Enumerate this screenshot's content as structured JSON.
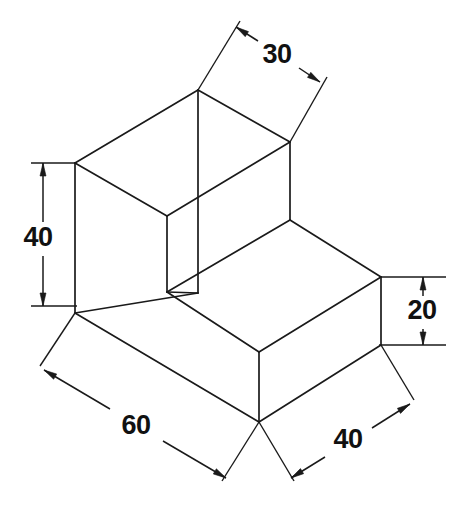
{
  "drawing": {
    "type": "isometric-technical-drawing",
    "subject": "stepped-block",
    "background_color": "#ffffff",
    "line_color": "#1a1a1a",
    "canvas": {
      "width": 458,
      "height": 508
    },
    "dimensions": [
      {
        "id": "depth-top",
        "label": "30",
        "text_x": 277,
        "text_y": 56,
        "line_start_x": 236,
        "line_start_y": 27,
        "line_end_x": 320,
        "line_end_y": 82,
        "gap_start_x": 258,
        "gap_start_y": 41,
        "gap_end_x": 299,
        "gap_end_y": 68,
        "ext_lines": [
          {
            "x1": 198,
            "y1": 90,
            "x2": 240,
            "y2": 21
          },
          {
            "x1": 290,
            "y1": 142,
            "x2": 327,
            "y2": 77
          }
        ]
      },
      {
        "id": "height-tall",
        "label": "40",
        "text_x": 38,
        "text_y": 239,
        "line_start_x": 43,
        "line_start_y": 163,
        "line_end_x": 43,
        "line_end_y": 306,
        "gap_start_x": 43,
        "gap_start_y": 222,
        "gap_end_x": 43,
        "gap_end_y": 256,
        "ext_lines": [
          {
            "x1": 31,
            "y1": 163,
            "x2": 77,
            "y2": 163
          },
          {
            "x1": 31,
            "y1": 306,
            "x2": 77,
            "y2": 306
          }
        ]
      },
      {
        "id": "height-step",
        "label": "20",
        "text_x": 422,
        "text_y": 312,
        "line_start_x": 423,
        "line_start_y": 277,
        "line_end_x": 423,
        "line_end_y": 345,
        "gap_start_x": 423,
        "gap_start_y": 296,
        "gap_end_x": 423,
        "gap_end_y": 329,
        "ext_lines": [
          {
            "x1": 379,
            "y1": 277,
            "x2": 446,
            "y2": 277
          },
          {
            "x1": 379,
            "y1": 345,
            "x2": 446,
            "y2": 345
          }
        ]
      },
      {
        "id": "width-front-left",
        "label": "60",
        "text_x": 136,
        "text_y": 427,
        "line_start_x": 44,
        "line_start_y": 370,
        "line_end_x": 226,
        "line_end_y": 478,
        "gap_start_x": 110,
        "gap_start_y": 409,
        "gap_end_x": 163,
        "gap_end_y": 441,
        "ext_lines": [
          {
            "x1": 75,
            "y1": 313,
            "x2": 40,
            "y2": 366
          },
          {
            "x1": 259,
            "y1": 422,
            "x2": 222,
            "y2": 481
          }
        ]
      },
      {
        "id": "width-front-right",
        "label": "40",
        "text_x": 348,
        "text_y": 441,
        "line_start_x": 291,
        "line_start_y": 478,
        "line_end_x": 410,
        "line_end_y": 404,
        "gap_start_x": 325,
        "gap_start_y": 457,
        "gap_end_x": 372,
        "gap_end_y": 428,
        "ext_lines": [
          {
            "x1": 259,
            "y1": 422,
            "x2": 294,
            "y2": 481
          },
          {
            "x1": 381,
            "y1": 345,
            "x2": 414,
            "y2": 400
          }
        ]
      }
    ],
    "edges": [
      {
        "id": "top-face-back-left",
        "x1": 75,
        "y1": 163,
        "x2": 198,
        "y2": 90
      },
      {
        "id": "top-face-back-right",
        "x1": 198,
        "y1": 90,
        "x2": 290,
        "y2": 142
      },
      {
        "id": "top-face-front-right",
        "x1": 290,
        "y1": 142,
        "x2": 167,
        "y2": 216
      },
      {
        "id": "top-face-front-left",
        "x1": 167,
        "y1": 216,
        "x2": 75,
        "y2": 163
      },
      {
        "id": "tall-vert-back",
        "x1": 198,
        "y1": 90,
        "x2": 198,
        "y2": 293
      },
      {
        "id": "tall-vert-left",
        "x1": 75,
        "y1": 163,
        "x2": 75,
        "y2": 313
      },
      {
        "id": "tall-vert-front",
        "x1": 167,
        "y1": 216,
        "x2": 167,
        "y2": 292
      },
      {
        "id": "tall-vert-right",
        "x1": 290,
        "y1": 142,
        "x2": 290,
        "y2": 220
      },
      {
        "id": "step-top-left",
        "x1": 167,
        "y1": 292,
        "x2": 259,
        "y2": 352
      },
      {
        "id": "step-top-right",
        "x1": 290,
        "y1": 220,
        "x2": 381,
        "y2": 277
      },
      {
        "id": "step-top-front",
        "x1": 259,
        "y1": 352,
        "x2": 381,
        "y2": 277
      },
      {
        "id": "step-top-back",
        "x1": 167,
        "y1": 292,
        "x2": 290,
        "y2": 220
      },
      {
        "id": "base-front-left",
        "x1": 75,
        "y1": 313,
        "x2": 259,
        "y2": 422
      },
      {
        "id": "base-front-right",
        "x1": 259,
        "y1": 422,
        "x2": 381,
        "y2": 345
      },
      {
        "id": "base-vert-front",
        "x1": 259,
        "y1": 352,
        "x2": 259,
        "y2": 422
      },
      {
        "id": "base-vert-right",
        "x1": 381,
        "y1": 277,
        "x2": 381,
        "y2": 345
      },
      {
        "id": "base-left-edge",
        "x1": 75,
        "y1": 313,
        "x2": 198,
        "y2": 293
      },
      {
        "id": "base-inner-diag",
        "x1": 198,
        "y1": 293,
        "x2": 167,
        "y2": 292
      }
    ]
  }
}
